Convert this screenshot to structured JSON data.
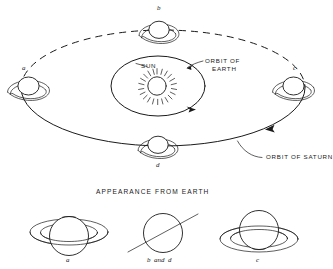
{
  "figure": {
    "title_caption": "APPEARANCE FROM EARTH",
    "background_color": "#ffffff",
    "ink_color": "#1a1a1a",
    "labels": {
      "sun": "SUN",
      "orbit_of_earth_line1": "ORBIT OF",
      "orbit_of_earth_line2": "EARTH",
      "orbit_of_saturn": "ORBIT OF SATURN"
    },
    "position_labels": {
      "a": "a",
      "b": "b",
      "c": "c",
      "d": "d"
    },
    "appearance_labels": {
      "a": "a",
      "bd": "b  and  d",
      "c": "c"
    },
    "orbit_notes": {
      "saturn_orbit_far_half": "dashed",
      "saturn_orbit_near_half": "solid",
      "earth_orbit": "solid"
    }
  }
}
